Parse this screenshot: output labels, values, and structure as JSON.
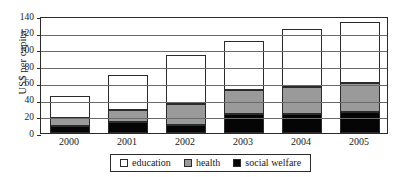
{
  "chart_data": {
    "type": "bar",
    "stacked": true,
    "title": "",
    "xlabel": "",
    "ylabel": "US$ per capita",
    "categories": [
      "2000",
      "2001",
      "2002",
      "2003",
      "2004",
      "2005"
    ],
    "ylim": [
      0,
      140
    ],
    "yticks": [
      0,
      20,
      40,
      60,
      80,
      100,
      120,
      140
    ],
    "ytick_labels": [
      "0",
      "20",
      "40",
      "60",
      "80",
      "100",
      "120",
      "140"
    ],
    "grid": true,
    "legend_position": "bottom",
    "series": [
      {
        "name": "social welfare",
        "color": "#050505",
        "values": [
          8,
          13,
          10,
          23,
          23,
          25
        ]
      },
      {
        "name": "health",
        "color": "#9a9a9a",
        "values": [
          10,
          15,
          25,
          29,
          32,
          35
        ]
      },
      {
        "name": "education",
        "color": "#ffffff",
        "values": [
          26,
          42,
          58,
          58,
          69,
          73
        ]
      }
    ],
    "cumulative_totals": [
      44,
      70,
      93,
      110,
      124,
      133
    ],
    "series_order_bottom_to_top": [
      "social welfare",
      "health",
      "education"
    ],
    "legend_entries": [
      {
        "label": "education",
        "color": "#ffffff"
      },
      {
        "label": "health",
        "color": "#9a9a9a"
      },
      {
        "label": "social welfare",
        "color": "#050505"
      }
    ]
  }
}
